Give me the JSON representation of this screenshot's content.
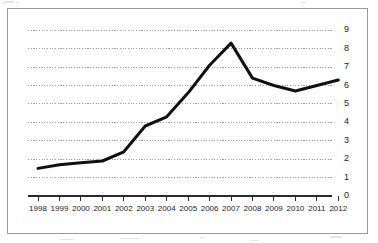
{
  "chart_data": {
    "type": "line",
    "title": "",
    "subtitle": "",
    "xlabel": "",
    "ylabel": "",
    "categories": [
      "1998",
      "1999",
      "2000",
      "2001",
      "2002",
      "2003",
      "2004",
      "2005",
      "2006",
      "2007",
      "2008",
      "2009",
      "2010",
      "2011",
      "2012"
    ],
    "values": [
      1.5,
      1.7,
      1.8,
      1.9,
      2.4,
      3.8,
      4.3,
      5.6,
      7.1,
      8.3,
      6.4,
      6.0,
      5.7,
      6.0,
      6.3
    ],
    "series": [
      {
        "name": "series-1",
        "values": [
          1.5,
          1.7,
          1.8,
          1.9,
          2.4,
          3.8,
          4.3,
          5.6,
          7.1,
          8.3,
          6.4,
          6.0,
          5.7,
          6.0,
          6.3
        ],
        "color": "#111111"
      }
    ],
    "ylim": [
      0,
      9
    ],
    "yticks": [
      0,
      1,
      2,
      3,
      4,
      5,
      6,
      7,
      8,
      9
    ],
    "ytick_labels": [
      "0",
      "1",
      "2",
      "3",
      "4",
      "5",
      "6",
      "7",
      "8",
      "9"
    ],
    "xtick_labels": [
      "1998",
      "1999",
      "2000",
      "2001",
      "2002",
      "2003",
      "2004",
      "2005",
      "2006",
      "2007",
      "2008",
      "2009",
      "2010",
      "2011",
      "2012"
    ],
    "grid": true,
    "grid_style": "dotted-horizontal",
    "grid_color": "#9b9b9b",
    "legend": false,
    "legend_position": "none",
    "annotations": [],
    "axis_color": "#2b2b2b",
    "frame_color": "#9a9a9a",
    "background": "#ffffff",
    "y_axis_side": "right",
    "line_width": 3
  }
}
